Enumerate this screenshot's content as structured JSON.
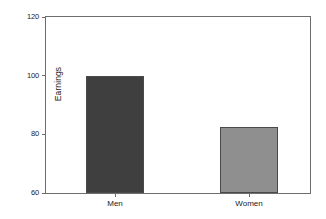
{
  "chart_data": {
    "type": "bar",
    "title": "",
    "subtitle": "",
    "xlabel": "",
    "ylabel": "Earnings",
    "categories": [
      "Men",
      "Women"
    ],
    "values": [
      100,
      82.5
    ],
    "series": [
      {
        "name": "Earnings",
        "values": [
          100,
          82.5
        ]
      }
    ],
    "ylim": [
      60,
      120
    ],
    "yticks": [
      60,
      80,
      100,
      120
    ],
    "ytick_labels": [
      "60",
      "80",
      "100",
      "120"
    ],
    "xtick_labels": [
      "Men",
      "Women"
    ],
    "grid": false,
    "legend": false,
    "legend_position": "none",
    "annotations": [],
    "bar_colors": [
      "#3f3f3f",
      "#8f8f8f"
    ],
    "bar_edge_color": "#4a4a4a",
    "axis_color": "#6e6e6e",
    "background_color": "#ffffff",
    "text_color": "#1a1a1a"
  }
}
